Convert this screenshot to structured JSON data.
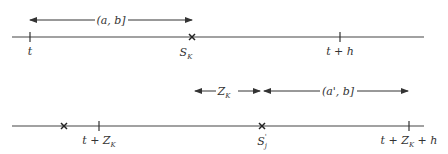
{
  "diagram": {
    "top_timeline": {
      "points": [
        {
          "label": "t",
          "kind": "tick",
          "x": 30
        },
        {
          "label": "S",
          "sub": "K",
          "kind": "cross",
          "x": 192
        },
        {
          "label": "t + h",
          "kind": "tick",
          "x": 340
        }
      ],
      "interval_arrow": {
        "label": "(a, b]",
        "from_x": 30,
        "to_x": 192
      }
    },
    "bottom_timeline": {
      "points": [
        {
          "label": "",
          "kind": "cross",
          "x": 64
        },
        {
          "label": "t + Z",
          "sub": "K",
          "kind": "tick",
          "x": 99
        },
        {
          "label": "S",
          "sub": "j",
          "sup": "'",
          "kind": "cross",
          "x": 262
        },
        {
          "label": "t + Z",
          "sub": "K",
          "suffix": " + h",
          "kind": "tick",
          "x": 409
        }
      ],
      "shift_arrow": {
        "label": "Z",
        "sub": "K",
        "from_x": 195,
        "to_x": 262
      },
      "interval_arrow": {
        "label": "(a', b]",
        "from_x": 262,
        "to_x": 408
      }
    },
    "colors": {
      "ink": "#333333",
      "background": "#ffffff"
    }
  }
}
